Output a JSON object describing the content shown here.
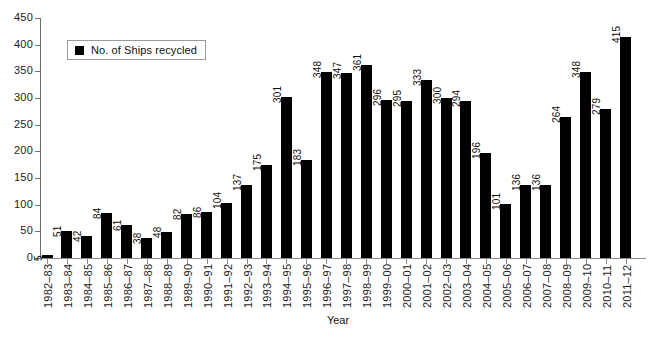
{
  "chart_data": {
    "type": "bar",
    "title": "",
    "xlabel": "Year",
    "ylabel": "",
    "ylim": [
      0,
      450
    ],
    "ytick_step": 50,
    "yticks": [
      0,
      50,
      100,
      150,
      200,
      250,
      300,
      350,
      400,
      450
    ],
    "grid": false,
    "legend_position": "top-left-inside",
    "legend": [
      "No. of Ships recycled"
    ],
    "bar_color": "#000000",
    "categories": [
      "1982–83",
      "1983–84",
      "1984–85",
      "1985–86",
      "1986–87",
      "1987–88",
      "1988–89",
      "1989–90",
      "1990–91",
      "1991–92",
      "1992–93",
      "1993–94",
      "1994–95",
      "1995–96",
      "1996–97",
      "1997–98",
      "1998–99",
      "1999–00",
      "2000–01",
      "2001–02",
      "2002–03",
      "2003–04",
      "2004–05",
      "2005–06",
      "2006–07",
      "2007–08",
      "2008–09",
      "2009–10",
      "2010–11",
      "2011–12"
    ],
    "values": [
      5,
      51,
      42,
      84,
      61,
      38,
      48,
      82,
      86,
      104,
      137,
      175,
      301,
      183,
      348,
      347,
      361,
      296,
      295,
      333,
      300,
      294,
      196,
      101,
      136,
      136,
      264,
      348,
      279,
      415
    ],
    "series": [
      {
        "name": "No. of Ships recycled",
        "values": [
          5,
          51,
          42,
          84,
          61,
          38,
          48,
          82,
          86,
          104,
          137,
          175,
          301,
          183,
          348,
          347,
          361,
          296,
          295,
          333,
          300,
          294,
          196,
          101,
          136,
          136,
          264,
          348,
          279,
          415
        ]
      }
    ]
  },
  "legend": {
    "label": "No. of Ships recycled",
    "swatch_color": "#000000"
  },
  "axes": {
    "x_title": "Year",
    "y_tick_labels": [
      "450",
      "400",
      "350",
      "300",
      "250",
      "200",
      "150",
      "100",
      "50",
      "0"
    ]
  },
  "caption": {
    "text": ""
  }
}
